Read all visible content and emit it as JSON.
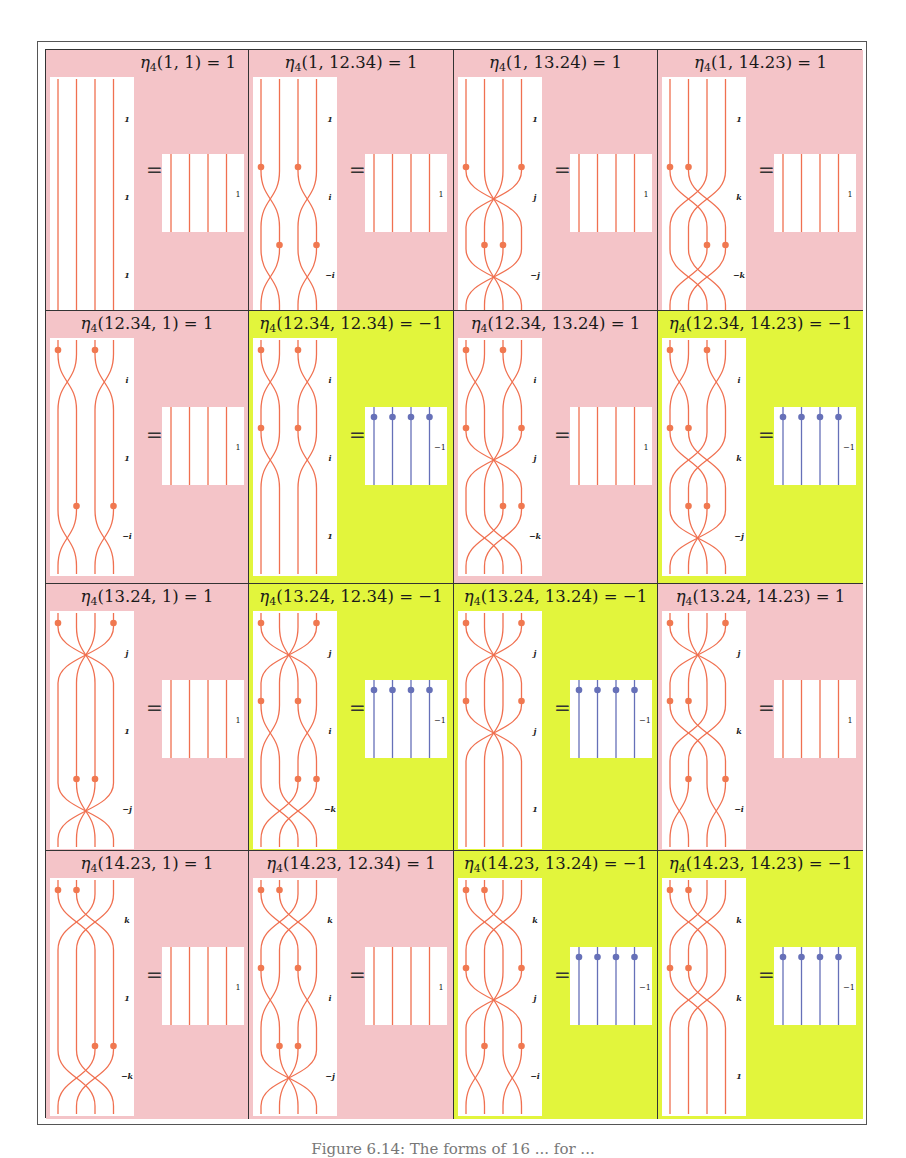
{
  "colors": {
    "pink": "#f4c4c8",
    "lime": "#e2f53c",
    "strand": "#f07050",
    "dot": "#f07850",
    "blue": "#6670b8",
    "white": "#ffffff"
  },
  "grid": {
    "rows": [
      "1",
      "12.34",
      "13.24",
      "14.23"
    ],
    "cols": [
      "1",
      "12.34",
      "13.24",
      "14.23"
    ]
  },
  "cells": [
    {
      "title_args": "(1, 1) = 1",
      "bg": "pink",
      "value": "1",
      "title_align": "right",
      "segments": [
        {
          "dots": [],
          "cross": "none",
          "label": "1"
        },
        {
          "dots": [],
          "cross": "none",
          "label": "1"
        },
        {
          "dots": [],
          "cross": "none",
          "label": "1"
        }
      ]
    },
    {
      "title_args": "(1, 12.34) = 1",
      "bg": "pink",
      "value": "1",
      "segments": [
        {
          "dots": [],
          "cross": "none",
          "label": "1"
        },
        {
          "dots": [
            0,
            2
          ],
          "cross": "i",
          "label": "i"
        },
        {
          "dots": [
            1,
            3
          ],
          "cross": "i",
          "label": "−i"
        }
      ]
    },
    {
      "title_args": "(1, 13.24) = 1",
      "bg": "pink",
      "value": "1",
      "segments": [
        {
          "dots": [],
          "cross": "none",
          "label": "1"
        },
        {
          "dots": [
            0,
            3
          ],
          "cross": "j",
          "label": "j"
        },
        {
          "dots": [
            1,
            2
          ],
          "cross": "j",
          "label": "−j"
        }
      ]
    },
    {
      "title_args": "(1, 14.23) = 1",
      "bg": "pink",
      "value": "1",
      "segments": [
        {
          "dots": [],
          "cross": "none",
          "label": "1"
        },
        {
          "dots": [
            0,
            1
          ],
          "cross": "k",
          "label": "k"
        },
        {
          "dots": [
            2,
            3
          ],
          "cross": "k",
          "label": "−k"
        }
      ]
    },
    {
      "title_args": "(12.34, 1) = 1",
      "bg": "pink",
      "value": "1",
      "segments": [
        {
          "dots": [
            0,
            2
          ],
          "cross": "i",
          "label": "i"
        },
        {
          "dots": [],
          "cross": "none",
          "label": "1"
        },
        {
          "dots": [
            1,
            3
          ],
          "cross": "i",
          "label": "−i"
        }
      ]
    },
    {
      "title_args": "(12.34, 12.34) = −1",
      "bg": "lime",
      "value": "−1",
      "segments": [
        {
          "dots": [
            0,
            2
          ],
          "cross": "i",
          "label": "i"
        },
        {
          "dots": [
            0,
            2
          ],
          "cross": "i",
          "label": "i"
        },
        {
          "dots": [],
          "cross": "none",
          "label": "1"
        }
      ]
    },
    {
      "title_args": "(12.34, 13.24) = 1",
      "bg": "pink",
      "value": "1",
      "segments": [
        {
          "dots": [
            0,
            2
          ],
          "cross": "i",
          "label": "i"
        },
        {
          "dots": [
            0,
            3
          ],
          "cross": "j",
          "label": "j"
        },
        {
          "dots": [
            2,
            3
          ],
          "cross": "k",
          "label": "−k"
        }
      ]
    },
    {
      "title_args": "(12.34, 14.23) = −1",
      "bg": "lime",
      "value": "−1",
      "segments": [
        {
          "dots": [
            0,
            2
          ],
          "cross": "i",
          "label": "i"
        },
        {
          "dots": [
            0,
            1
          ],
          "cross": "k",
          "label": "k"
        },
        {
          "dots": [
            1,
            2
          ],
          "cross": "j",
          "label": "−j"
        }
      ]
    },
    {
      "title_args": "(13.24, 1) = 1",
      "bg": "pink",
      "value": "1",
      "segments": [
        {
          "dots": [
            0,
            3
          ],
          "cross": "j",
          "label": "j"
        },
        {
          "dots": [],
          "cross": "none",
          "label": "1"
        },
        {
          "dots": [
            1,
            2
          ],
          "cross": "j",
          "label": "−j"
        }
      ]
    },
    {
      "title_args": "(13.24, 12.34) = −1",
      "bg": "lime",
      "value": "−1",
      "segments": [
        {
          "dots": [
            0,
            3
          ],
          "cross": "j",
          "label": "j"
        },
        {
          "dots": [
            0,
            2
          ],
          "cross": "i",
          "label": "i"
        },
        {
          "dots": [
            2,
            3
          ],
          "cross": "k",
          "label": "−k"
        }
      ]
    },
    {
      "title_args": "(13.24, 13.24) = −1",
      "bg": "lime",
      "value": "−1",
      "segments": [
        {
          "dots": [
            0,
            3
          ],
          "cross": "j",
          "label": "j"
        },
        {
          "dots": [
            0,
            3
          ],
          "cross": "j",
          "label": "j"
        },
        {
          "dots": [],
          "cross": "none",
          "label": "1"
        }
      ]
    },
    {
      "title_args": "(13.24, 14.23) = 1",
      "bg": "pink",
      "value": "1",
      "segments": [
        {
          "dots": [
            0,
            3
          ],
          "cross": "j",
          "label": "j"
        },
        {
          "dots": [
            0,
            1
          ],
          "cross": "k",
          "label": "k"
        },
        {
          "dots": [
            1,
            3
          ],
          "cross": "i",
          "label": "−i"
        }
      ]
    },
    {
      "title_args": "(14.23, 1) = 1",
      "bg": "pink",
      "value": "1",
      "segments": [
        {
          "dots": [
            0,
            1
          ],
          "cross": "k",
          "label": "k"
        },
        {
          "dots": [],
          "cross": "none",
          "label": "1"
        },
        {
          "dots": [
            2,
            3
          ],
          "cross": "k",
          "label": "−k"
        }
      ]
    },
    {
      "title_args": "(14.23, 12.34) = 1",
      "bg": "pink",
      "value": "1",
      "segments": [
        {
          "dots": [
            0,
            1
          ],
          "cross": "k",
          "label": "k"
        },
        {
          "dots": [
            0,
            2
          ],
          "cross": "i",
          "label": "i"
        },
        {
          "dots": [
            1,
            2
          ],
          "cross": "j",
          "label": "−j"
        }
      ]
    },
    {
      "title_args": "(14.23, 13.24) = −1",
      "bg": "lime",
      "value": "−1",
      "segments": [
        {
          "dots": [
            0,
            1
          ],
          "cross": "k",
          "label": "k"
        },
        {
          "dots": [
            0,
            3
          ],
          "cross": "j",
          "label": "j"
        },
        {
          "dots": [
            1,
            3
          ],
          "cross": "i",
          "label": "−i"
        }
      ]
    },
    {
      "title_args": "(14.23, 14.23) = −1",
      "bg": "lime",
      "value": "−1",
      "segments": [
        {
          "dots": [
            0,
            1
          ],
          "cross": "k",
          "label": "k"
        },
        {
          "dots": [
            0,
            1
          ],
          "cross": "k",
          "label": "k"
        },
        {
          "dots": [],
          "cross": "none",
          "label": "1"
        }
      ]
    }
  ],
  "equals_sign": "=",
  "title_prefix": "η",
  "title_subscript": "4",
  "caption": "Figure 6.14: The forms of 16 ... for ..."
}
